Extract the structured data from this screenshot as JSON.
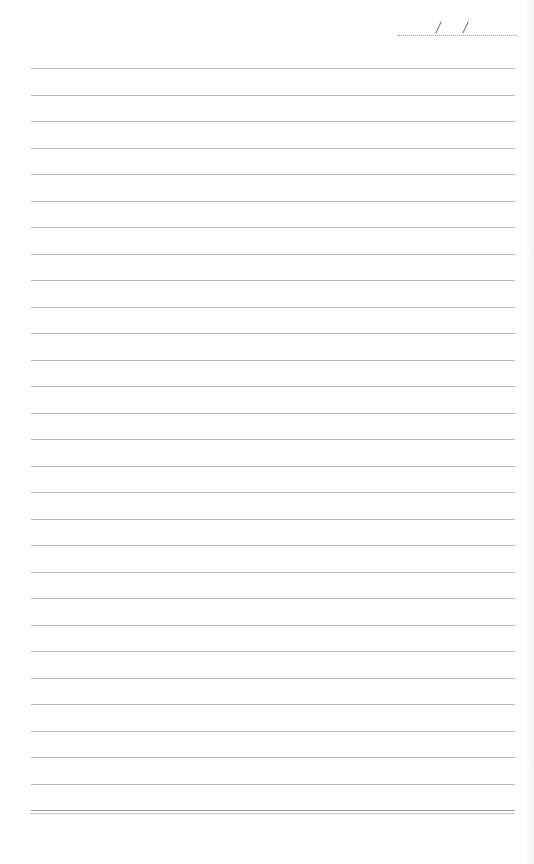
{
  "page": {
    "type": "lined notebook page",
    "date_field": {
      "separator_1": "/",
      "separator_2": "/",
      "value": ""
    },
    "ruled_line_count": 28,
    "footer_double_line": true,
    "line_color": "#b8b8b8",
    "background": "#fefefe"
  }
}
